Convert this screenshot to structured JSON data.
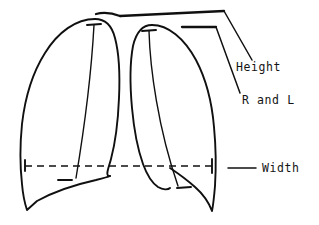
{
  "figure": {
    "type": "hand-drawn line diagram",
    "background_color": "#ffffff",
    "ink_color": "#101010"
  },
  "labels": {
    "height": "Height",
    "r_and_l": "R and L",
    "width": "Width"
  },
  "annotations": {
    "height_leader": "leader-line-height",
    "r_and_l_leader": "leader-line-r-and-l",
    "width_leader": "leader-line-width",
    "width_measure_line": "dashed-width-measurement-line"
  },
  "shapes": {
    "left_lung": "left-lung-outline",
    "right_lung": "right-lung-outline",
    "left_lung_hilum_line": "left-lung-inner-line",
    "right_lung_hilum_line": "right-lung-inner-line",
    "left_apex_tick": "left-lung-apex-tick",
    "right_apex_tick": "right-lung-apex-tick",
    "left_base_tick": "left-lung-base-tick",
    "right_base_tick": "right-lung-base-tick",
    "width_left_end_tick": "width-line-left-end-tick",
    "width_right_end_tick": "width-line-right-end-tick",
    "height_bracket_upper": "upper-height-bracket",
    "height_bracket_lower": "lower-r-and-l-bracket"
  }
}
